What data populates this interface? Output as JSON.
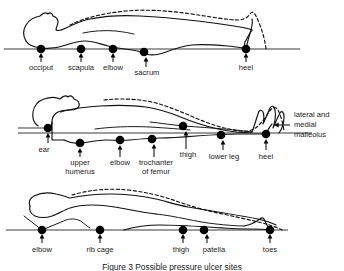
{
  "figure": {
    "caption": "Figure 3  Possible pressure ulcer sites",
    "panels": [
      {
        "id": "supine",
        "name": "supine-position",
        "baseline_y": 49,
        "labels": [
          {
            "text": "occiput",
            "dot_x": 41,
            "dot_y": 49,
            "label_x": 41,
            "label_y": 69
          },
          {
            "text": "scapula",
            "dot_x": 81,
            "dot_y": 49,
            "label_x": 81,
            "label_y": 69
          },
          {
            "text": "elbow",
            "dot_x": 113,
            "dot_y": 49,
            "label_x": 113,
            "label_y": 69
          },
          {
            "text": "sacrum",
            "dot_x": 144,
            "dot_y": 52,
            "label_x": 146,
            "label_y": 74
          },
          {
            "text": "heel",
            "dot_x": 246,
            "dot_y": 49,
            "label_x": 246,
            "label_y": 69
          }
        ]
      },
      {
        "id": "side-lying",
        "name": "side-lying-position",
        "baseline_y": 133,
        "labels": [
          {
            "text": "ear",
            "dot_x": 48,
            "dot_y": 128,
            "label_x": 44,
            "label_y": 150
          },
          {
            "text": "upper humerus",
            "line2": "humerus",
            "line1": "upper",
            "dot_x": 80,
            "dot_y": 143,
            "label_x": 80,
            "label_y": 163
          },
          {
            "text": "elbow",
            "dot_x": 120,
            "dot_y": 140,
            "label_x": 120,
            "label_y": 163
          },
          {
            "text": "trochanter of femur",
            "line1": "trochanter",
            "line2": "of femur",
            "dot_x": 152,
            "dot_y": 139,
            "label_x": 154,
            "label_y": 163
          },
          {
            "text": "thigh",
            "dot_x": 183,
            "dot_y": 126,
            "label_x": 186,
            "label_y": 155
          },
          {
            "text": "lower leg",
            "dot_x": 221,
            "dot_y": 135,
            "label_x": 223,
            "label_y": 157
          },
          {
            "text": "heel",
            "dot_x": 266,
            "dot_y": 135,
            "label_x": 266,
            "label_y": 157
          }
        ],
        "callout": {
          "text": "lateral and medial malleolus",
          "line1": "lateral and",
          "line2": "medial",
          "line3": "malleolus",
          "label_x": 292,
          "label_y": 122,
          "arrow_from_x": 289,
          "arrow_to_x": 272,
          "arrow_y": 126
        }
      },
      {
        "id": "prone",
        "name": "prone-position",
        "baseline_y": 230,
        "labels": [
          {
            "text": "elbow",
            "dot_x": 42,
            "dot_y": 230,
            "label_x": 42,
            "label_y": 250
          },
          {
            "text": "rib cage",
            "dot_x": 100,
            "dot_y": 230,
            "label_x": 100,
            "label_y": 250
          },
          {
            "text": "thigh",
            "dot_x": 183,
            "dot_y": 230,
            "label_x": 181,
            "label_y": 250
          },
          {
            "text": "patella",
            "dot_x": 204,
            "dot_y": 230,
            "label_x": 212,
            "label_y": 250
          },
          {
            "text": "toes",
            "dot_x": 270,
            "dot_y": 230,
            "label_x": 270,
            "label_y": 250
          }
        ]
      }
    ]
  },
  "colors": {
    "ink": "#111111",
    "baseline": "#3a3a3a",
    "dot": "#000000",
    "background": "#ffffff"
  }
}
